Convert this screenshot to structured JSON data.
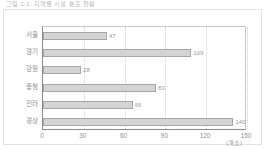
{
  "caption": "그림 1-1. 지역별 시설 분포 현황",
  "unit_label": "(개소)",
  "axis": {
    "ticks": [
      "0",
      "30",
      "60",
      "90",
      "120",
      "150"
    ]
  },
  "chart_data": {
    "type": "bar",
    "orientation": "horizontal",
    "title": "그림 1-1. 지역별 시설 분포 현황",
    "xlabel": "(개소)",
    "ylabel": "",
    "categories": [
      "서울",
      "경기",
      "강원",
      "충청",
      "전라",
      "경상"
    ],
    "values": [
      47,
      109,
      28,
      83,
      66,
      140
    ],
    "xlim": [
      0,
      150
    ],
    "xticks": [
      0,
      30,
      60,
      90,
      120,
      150
    ],
    "grid": true,
    "legend": false,
    "bar_color": "#d4d4d4",
    "bar_edge_color": "#a6a6a6",
    "text_color": "#8f8f8f"
  }
}
